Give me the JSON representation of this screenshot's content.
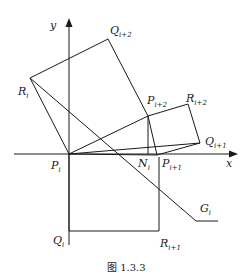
{
  "figure": {
    "caption": "图 1.3.3",
    "axes": {
      "x_label": "x",
      "y_label": "y"
    },
    "points": {
      "P_i": {
        "base": "P",
        "sub": "i"
      },
      "Q_i": {
        "base": "Q",
        "sub": "i"
      },
      "R_i": {
        "base": "R",
        "sub": "i"
      },
      "N_i": {
        "base": "N",
        "sub": "i"
      },
      "G_i": {
        "base": "G",
        "sub": "i"
      },
      "P_i1": {
        "base": "P",
        "sub": "i+1"
      },
      "Q_i1": {
        "base": "Q",
        "sub": "i+1"
      },
      "R_i1": {
        "base": "R",
        "sub": "i+1"
      },
      "P_i2": {
        "base": "P",
        "sub": "i+2"
      },
      "Q_i2": {
        "base": "Q",
        "sub": "i+2"
      },
      "R_i2": {
        "base": "R",
        "sub": "i+2"
      }
    }
  }
}
